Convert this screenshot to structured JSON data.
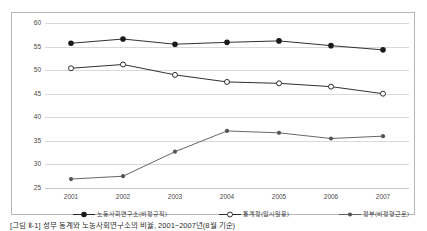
{
  "chart_data": {
    "type": "line",
    "title": "",
    "xlabel": "",
    "ylabel": "",
    "categories": [
      "2001",
      "2002",
      "2003",
      "2004",
      "2005",
      "2006",
      "2007"
    ],
    "ylim": [
      25,
      60
    ],
    "yticks": [
      "25",
      "30",
      "35",
      "40",
      "45",
      "50",
      "55",
      "60"
    ],
    "grid": true,
    "legend_position": "bottom",
    "series": [
      {
        "name": "노동사회연구소(비정규직)",
        "marker": "filled-circle",
        "color": "#1a1a1a",
        "values": [
          55.7,
          56.6,
          55.5,
          55.9,
          56.2,
          55.2,
          54.3
        ]
      },
      {
        "name": "통계청(임시일용)",
        "marker": "open-circle",
        "color": "#1a1a1a",
        "values": [
          50.4,
          51.2,
          49.0,
          47.5,
          47.2,
          46.5,
          45.0
        ]
      },
      {
        "name": "정부(비정형근로)",
        "marker": "small-filled-circle",
        "color": "#555555",
        "values": [
          26.9,
          27.5,
          32.7,
          37.1,
          36.7,
          35.5,
          36.0
        ]
      }
    ]
  },
  "caption": {
    "text": "[그림 Ⅱ-1] 정부 통계와 노동사회연구소의 비율, 2001~2007년(8월 기준)"
  },
  "colors": {
    "frame_border": "#b6b6b6",
    "gridline": "#d9d9d9",
    "axis": "#c4c4c4",
    "tick_text": "#4a4a4a",
    "legend_text": "#3b3b3b"
  }
}
